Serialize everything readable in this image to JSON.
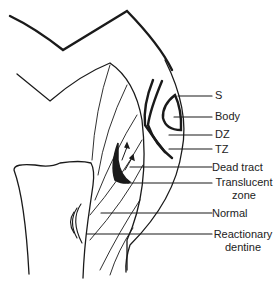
{
  "diagram": {
    "labels": {
      "s": "S",
      "body": "Body",
      "dz": "DZ",
      "tz": "TZ",
      "dead_tract": "Dead tract",
      "translucent_1": "Translucent",
      "translucent_2": "zone",
      "normal": "Normal",
      "reactionary_1": "Reactionary",
      "reactionary_2": "dentine"
    },
    "colors": {
      "line": "#1a1a1a",
      "background": "#ffffff"
    }
  }
}
